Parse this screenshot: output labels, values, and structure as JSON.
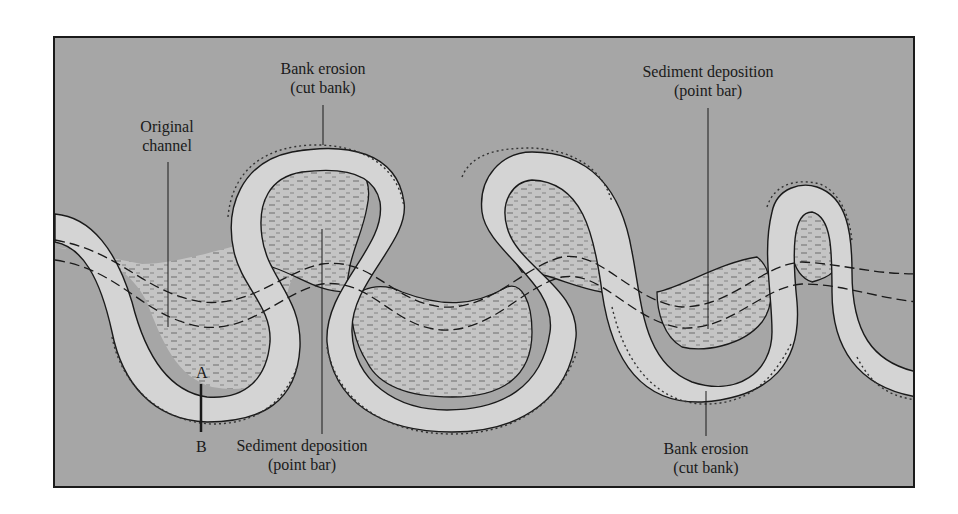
{
  "diagram": {
    "type": "meandering-river",
    "colors": {
      "floodplain": "#a6a6a6",
      "river_channel": "#d4d4d4",
      "point_bar": "#c4c4c4",
      "line": "#1a1a1a"
    },
    "labels": {
      "original_channel": {
        "line1": "Original",
        "line2": "channel"
      },
      "bank_erosion_top": {
        "line1": "Bank erosion",
        "line2": "(cut bank)"
      },
      "sediment_deposition_top": {
        "line1": "Sediment deposition",
        "line2": "(point bar)"
      },
      "sediment_deposition_bottom": {
        "line1": "Sediment deposition",
        "line2": "(point bar)"
      },
      "bank_erosion_bottom": {
        "line1": "Bank erosion",
        "line2": "(cut bank)"
      },
      "point_a": "A",
      "point_b": "B"
    }
  }
}
